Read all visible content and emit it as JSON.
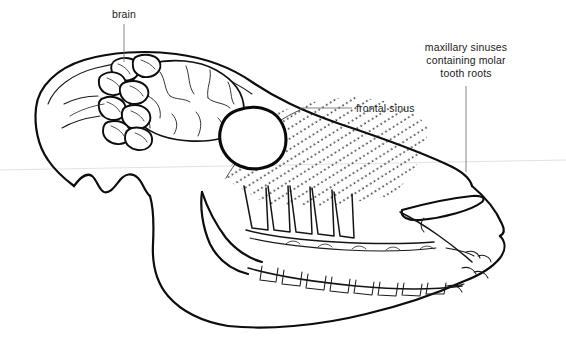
{
  "figure": {
    "background_color": "#ffffff",
    "ink_color": "#0d0d0d",
    "leader_color": "#6e6e6e"
  },
  "labels": [
    {
      "id": "brain",
      "text": "brain",
      "lines": [
        "brain"
      ],
      "x": 124,
      "y": 18,
      "align": "middle",
      "leader": {
        "from_x": 124,
        "from_y": 24,
        "to_x": 124,
        "to_y": 62
      }
    },
    {
      "id": "frontal-sinus",
      "text": "frontal sinus",
      "lines": [
        "frontal sinus"
      ],
      "x": 356,
      "y": 112,
      "align": "start",
      "leader": {
        "from_x": 352,
        "from_y": 108,
        "to_x": 300,
        "to_y": 108
      }
    },
    {
      "id": "maxillary-sinuses",
      "text": "maxillary sinuses containing molar tooth roots",
      "lines": [
        "maxillary sinuses",
        "containing molar",
        "tooth roots"
      ],
      "x": 466,
      "y": 51,
      "align": "middle",
      "leader": {
        "from_x": 466,
        "from_y": 86,
        "to_x": 466,
        "to_y": 172
      }
    }
  ],
  "anatomy": {
    "regions": [
      {
        "name": "cranium",
        "description": "rounded braincase at upper left"
      },
      {
        "name": "cerebellum",
        "description": "lobed folia cluster left of cerebrum"
      },
      {
        "name": "cerebrum",
        "description": "convoluted brain mass with sulci"
      },
      {
        "name": "frontal-sinus",
        "description": "rounded blob outline below brain"
      },
      {
        "name": "maxillary-sinus",
        "description": "stippled diagonal hatched region over molar roots"
      },
      {
        "name": "upper-molars",
        "description": "row of upper cheek teeth with long roots"
      },
      {
        "name": "lower-molars",
        "description": "row of mandibular cheek teeth"
      },
      {
        "name": "mandible",
        "description": "lower jaw with ramus and coronoid process"
      },
      {
        "name": "nasal-opening",
        "description": "elongated almond aperture at muzzle"
      },
      {
        "name": "incisors",
        "description": "front teeth at muzzle tip"
      },
      {
        "name": "diastema",
        "description": "toothless gap between incisors and molars"
      },
      {
        "name": "occipital",
        "description": "rear skull margin"
      }
    ],
    "stipple": {
      "pattern": "diagonal dotted lines",
      "direction": "lower-left to upper-right",
      "dot_color": "#1c1c1c"
    }
  }
}
